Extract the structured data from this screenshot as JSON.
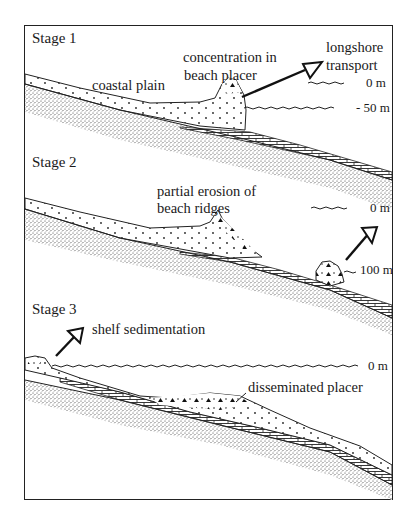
{
  "figure": {
    "stages": [
      {
        "label": "Stage 1",
        "annotations": {
          "plain": "coastal plain",
          "placer_line1": "concentration in",
          "placer_line2": "beach placer",
          "transport_line1": "longshore",
          "transport_line2": "transport"
        },
        "sea_levels": [
          "0 m",
          "- 50 m"
        ]
      },
      {
        "label": "Stage 2",
        "annotations": {
          "erosion_line1": "partial erosion of",
          "erosion_line2": "beach ridges"
        },
        "sea_levels": [
          "0 m",
          "100 m"
        ]
      },
      {
        "label": "Stage 3",
        "annotations": {
          "shelf": "shelf sedimentation",
          "disseminated": "disseminated placer"
        },
        "sea_levels": [
          "0 m"
        ]
      }
    ],
    "legend_patterns": {
      "bedrock": "fine stipple",
      "sand": "sparse dots",
      "mud": "brick/dash hatch",
      "heavy_minerals": "triangles"
    },
    "colors": {
      "ink": "#1a1a1a",
      "paper": "#ffffff"
    }
  }
}
